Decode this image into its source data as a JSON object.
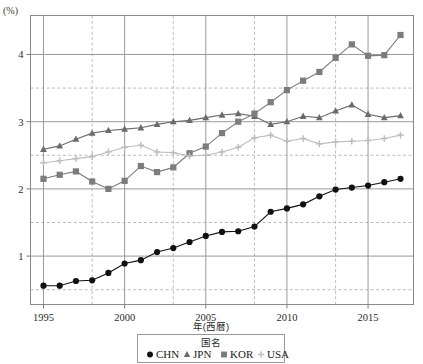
{
  "chart_data": {
    "type": "line",
    "title": "",
    "xlabel": "年(西暦)",
    "ylabel": "(%)",
    "xlim": [
      1994.2,
      2017.8
    ],
    "ylim": [
      0.28,
      4.58
    ],
    "grid": true,
    "major_gridlines_y": [
      1,
      2,
      3,
      4
    ],
    "minor_gridlines_y": [
      0.5,
      1.5,
      2.5,
      3.5
    ],
    "major_gridlines_x": [
      1995,
      2000,
      2005,
      2010,
      2015
    ],
    "minor_gridlines_x": [
      1998,
      2003,
      2008,
      2013
    ],
    "x": [
      1995,
      1996,
      1997,
      1998,
      1999,
      2000,
      2001,
      2002,
      2003,
      2004,
      2005,
      2006,
      2007,
      2008,
      2009,
      2010,
      2011,
      2012,
      2013,
      2014,
      2015,
      2016,
      2017
    ],
    "xticks": [
      "1995",
      "2000",
      "2005",
      "2010",
      "2015"
    ],
    "yticks": [
      "1",
      "2",
      "3",
      "4"
    ],
    "legend_title": "国名",
    "legend_position": "bottom",
    "series": [
      {
        "name": "CHN",
        "marker": "circle",
        "color": "#111111",
        "values": [
          0.56,
          0.56,
          0.63,
          0.64,
          0.75,
          0.89,
          0.94,
          1.06,
          1.12,
          1.21,
          1.3,
          1.36,
          1.37,
          1.44,
          1.66,
          1.71,
          1.77,
          1.89,
          1.99,
          2.02,
          2.05,
          2.1,
          2.15
        ]
      },
      {
        "name": "JPN",
        "marker": "triangle",
        "color": "#6b6b6b",
        "values": [
          2.59,
          2.64,
          2.74,
          2.83,
          2.87,
          2.89,
          2.91,
          2.96,
          3.0,
          3.02,
          3.06,
          3.1,
          3.12,
          3.08,
          2.96,
          3.0,
          3.08,
          3.06,
          3.16,
          3.25,
          3.11,
          3.06,
          3.09
        ]
      },
      {
        "name": "KOR",
        "marker": "square",
        "color": "#7c7c7c",
        "values": [
          2.15,
          2.21,
          2.26,
          2.11,
          2.0,
          2.12,
          2.34,
          2.25,
          2.32,
          2.53,
          2.63,
          2.83,
          3.0,
          3.12,
          3.29,
          3.47,
          3.61,
          3.74,
          3.95,
          4.15,
          3.98,
          3.99,
          4.29
        ]
      },
      {
        "name": "USA",
        "marker": "plus",
        "color": "#bdbdbd",
        "values": [
          2.39,
          2.42,
          2.45,
          2.48,
          2.55,
          2.62,
          2.65,
          2.55,
          2.54,
          2.49,
          2.5,
          2.55,
          2.62,
          2.76,
          2.8,
          2.71,
          2.75,
          2.67,
          2.7,
          2.71,
          2.72,
          2.75,
          2.8
        ]
      }
    ]
  },
  "legend": {
    "title": "国名",
    "entries": [
      {
        "label": "CHN",
        "marker": "circle"
      },
      {
        "label": "JPN",
        "marker": "triangle"
      },
      {
        "label": "KOR",
        "marker": "square"
      },
      {
        "label": "USA",
        "marker": "plus"
      }
    ]
  },
  "axes": {
    "y_unit_label": "(%)",
    "x_axis_title": "年(西暦)"
  },
  "colors": {
    "chn": "#111111",
    "jpn": "#6b6b6b",
    "kor": "#7c7c7c",
    "usa": "#bdbdbd",
    "grid_major": "#9a9a9a",
    "grid_minor": "#b5b5b5",
    "frame": "#8a8a8a"
  }
}
